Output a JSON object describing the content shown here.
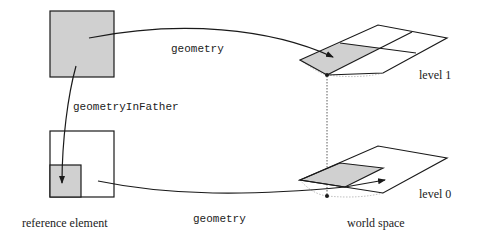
{
  "diagram": {
    "labels": {
      "geometry_top": "geometry",
      "geometry_in_father": "geometryInFather",
      "geometry_bottom": "geometry",
      "level1": "level 1",
      "level0": "level 0",
      "reference_element": "reference element",
      "world_space": "world space"
    },
    "colors": {
      "stroke": "#1a1a1a",
      "fill_shaded": "#d0d0d0",
      "dashed": "#999999"
    }
  }
}
